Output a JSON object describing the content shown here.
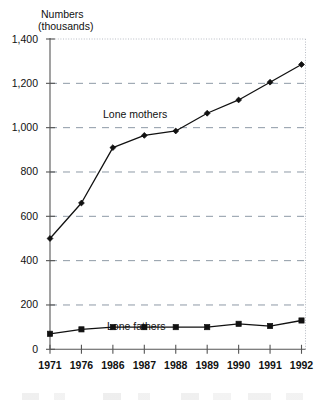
{
  "chart_data": {
    "type": "line",
    "title": "",
    "xlabel": "",
    "ylabel": "Numbers (thousands)",
    "ylabel_line1": "Numbers",
    "ylabel_line2": "(thousands)",
    "categories": [
      "1971",
      "1976",
      "1986",
      "1987",
      "1988",
      "1989",
      "1990",
      "1991",
      "1992"
    ],
    "ylim": [
      0,
      1400
    ],
    "xlim_labels": [
      "1971",
      "1992"
    ],
    "ytick_labels": [
      "0",
      "200",
      "400",
      "600",
      "800",
      "1,000",
      "1,200",
      "1,400"
    ],
    "ytick_values": [
      0,
      200,
      400,
      600,
      800,
      1000,
      1200,
      1400
    ],
    "grid": "horizontal-dashed",
    "legend_position": "inline-annotations",
    "series": [
      {
        "name": "Lone mothers",
        "marker": "diamond",
        "color": "#111111",
        "values": [
          500,
          660,
          910,
          965,
          985,
          1065,
          1125,
          1205,
          1285
        ]
      },
      {
        "name": "Lone fathers",
        "marker": "square",
        "color": "#111111",
        "values": [
          70,
          90,
          100,
          100,
          100,
          100,
          115,
          105,
          130
        ]
      }
    ],
    "annotations": [
      {
        "text": "Lone mothers",
        "series": "Lone mothers"
      },
      {
        "text": "Lone fathers",
        "series": "Lone fathers"
      }
    ]
  },
  "colors": {
    "line": "#111111",
    "gridline": "#8e9aa6",
    "axis": "#555555",
    "plot_border": "#b8bcc4",
    "background": "#ffffff"
  }
}
